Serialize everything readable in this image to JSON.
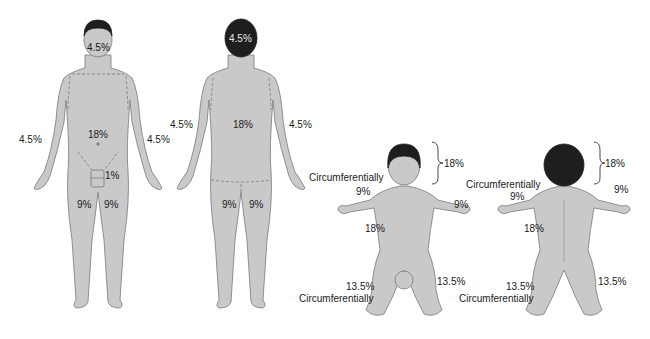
{
  "colors": {
    "skin": "#c9c9c9",
    "outline": "#7a7a7a",
    "hair": "#1e1e1e",
    "text": "#1a1a1a",
    "background": "#ffffff"
  },
  "adult_front": {
    "head": "4.5%",
    "left_arm": "4.5%",
    "right_arm": "4.5%",
    "trunk": "18%",
    "genitalia": "1%",
    "left_leg": "9%",
    "right_leg": "9%"
  },
  "adult_back": {
    "head": "4.5%",
    "left_arm": "4.5%",
    "right_arm": "4.5%",
    "trunk": "18%",
    "left_leg": "9%",
    "right_leg": "9%"
  },
  "child_front": {
    "head_bracket": "18%",
    "circumferential_note": "Circumferentially",
    "left_arm": "9%",
    "right_arm": "9%",
    "trunk": "18%",
    "left_leg": "13.5%",
    "left_leg_note": "Circumferentially",
    "right_leg": "13.5%"
  },
  "child_back": {
    "head_bracket": "18%",
    "circumferential_note": "Circumferentially",
    "left_arm": "9%",
    "right_arm": "9%",
    "trunk": "18%",
    "left_leg": "13.5%",
    "left_leg_note": "Circumferentially",
    "right_leg": "13.5%"
  }
}
